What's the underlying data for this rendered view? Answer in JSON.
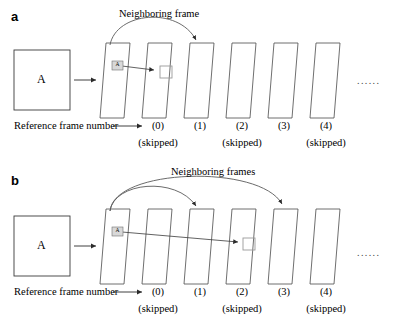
{
  "figure": {
    "type": "diagram",
    "background_color": "#ffffff",
    "stroke_color": "#3a3a3a",
    "text_color": "#000000",
    "marker_fill": "#d8d8d8"
  },
  "panels": [
    {
      "label": "a",
      "block_label": "A",
      "annotation": "Neighboring frame",
      "axis_label": "Reference frame number",
      "frame_tag": "A",
      "frames": [
        {
          "number": "(0)",
          "skipped_label": "(skipped)",
          "skipped": true
        },
        {
          "number": "(1)",
          "skipped_label": "",
          "skipped": false
        },
        {
          "number": "(2)",
          "skipped_label": "(skipped)",
          "skipped": true
        },
        {
          "number": "(3)",
          "skipped_label": "",
          "skipped": false
        },
        {
          "number": "(4)",
          "skipped_label": "(skipped)",
          "skipped": true
        }
      ],
      "ellipsis": "......",
      "neighbor_arcs": [
        {
          "from_frame": 0,
          "to_frame": 1
        }
      ],
      "motion_vector": {
        "from_frame": 0,
        "to_frame": 1
      }
    },
    {
      "label": "b",
      "block_label": "A",
      "annotation": "Neighboring frames",
      "axis_label": "Reference frame number",
      "frame_tag": "A",
      "frames": [
        {
          "number": "(0)",
          "skipped_label": "(skipped)",
          "skipped": true
        },
        {
          "number": "(1)",
          "skipped_label": "",
          "skipped": false
        },
        {
          "number": "(2)",
          "skipped_label": "(skipped)",
          "skipped": true
        },
        {
          "number": "(3)",
          "skipped_label": "",
          "skipped": false
        },
        {
          "number": "(4)",
          "skipped_label": "(skipped)",
          "skipped": true
        }
      ],
      "ellipsis": "......",
      "neighbor_arcs": [
        {
          "from_frame": 0,
          "to_frame": 1
        },
        {
          "from_frame": 0,
          "to_frame": 3
        }
      ],
      "motion_vector": {
        "from_frame": 0,
        "to_frame": 2
      }
    }
  ]
}
